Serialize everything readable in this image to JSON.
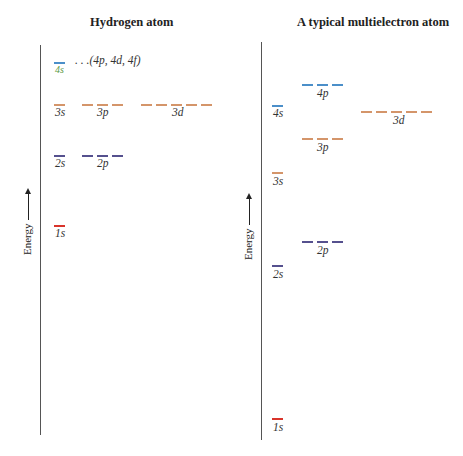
{
  "colors": {
    "n1": "#d9342b",
    "n2": "#55508e",
    "n3": "#d4956a",
    "n4": "#4b8fc9",
    "axis": "#555555"
  },
  "panels": {
    "hydrogen": {
      "title": "Hydrogen atom",
      "axis_label": "Energy",
      "note": ". . .(4p, 4d, 4f)",
      "levels": [
        {
          "label": "4s",
          "n": 4,
          "count": 1
        },
        {
          "label": "3s",
          "n": 3,
          "count": 1
        },
        {
          "label": "3p",
          "n": 3,
          "count": 3
        },
        {
          "label": "3d",
          "n": 3,
          "count": 5
        },
        {
          "label": "2s",
          "n": 2,
          "count": 1
        },
        {
          "label": "2p",
          "n": 2,
          "count": 3
        },
        {
          "label": "1s",
          "n": 1,
          "count": 1
        }
      ]
    },
    "multielectron": {
      "title": "A typical multielectron atom",
      "axis_label": "Energy",
      "levels": [
        {
          "label": "4p",
          "n": 4,
          "count": 3
        },
        {
          "label": "4s",
          "n": 4,
          "count": 1
        },
        {
          "label": "3d",
          "n": 3,
          "count": 5
        },
        {
          "label": "3p",
          "n": 3,
          "count": 3
        },
        {
          "label": "3s",
          "n": 3,
          "count": 1
        },
        {
          "label": "2p",
          "n": 2,
          "count": 3
        },
        {
          "label": "2s",
          "n": 2,
          "count": 1
        },
        {
          "label": "1s",
          "n": 1,
          "count": 1
        }
      ]
    }
  }
}
